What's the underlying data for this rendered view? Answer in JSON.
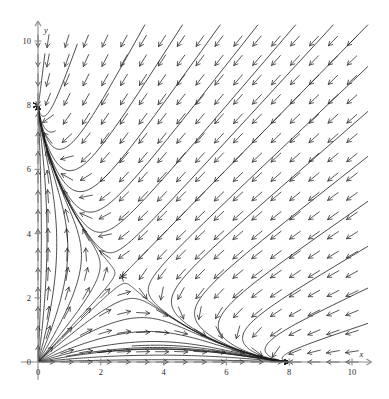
{
  "figure": {
    "title": "",
    "background_color": "#ffffff",
    "axis_color": "#8c8c8c",
    "arrow_color": "#3a3a3a",
    "trajectory_color": "#1d1d1d",
    "width": 389,
    "height": 399
  },
  "chart_data": {
    "type": "scatter",
    "plot_kind": "direction-field-phase-portrait",
    "title": "",
    "xlabel": "x",
    "ylabel": "y",
    "xlim": [
      0,
      10.6
    ],
    "ylim": [
      0,
      10.6
    ],
    "xticks": [
      0,
      2,
      4,
      6,
      8,
      10
    ],
    "yticks": [
      0,
      2,
      4,
      6,
      8,
      10
    ],
    "xtick_labels": [
      "0",
      "2",
      "4",
      "6",
      "8",
      "10"
    ],
    "ytick_labels": [
      "0",
      "2",
      "4",
      "6",
      "8",
      "10"
    ],
    "minor_tick_step": 0.5,
    "grid": false,
    "legend": null,
    "axes_position": "origin-crossed, arrows on both axes",
    "origin_px": [
      38,
      362
    ],
    "pixels_per_unit_x": 31.4,
    "pixels_per_unit_y": 32.1,
    "field": {
      "description": "normalized direction field of a two-species competition system",
      "glyph": "unit arrow with open arrowhead",
      "grid_cols": 18,
      "grid_rows": 18,
      "grid_x_start": 0.32,
      "grid_y_start": 0.32,
      "grid_step_x": 0.605,
      "grid_step_y": 0.605,
      "model": "dx/dt = x*(8 - x - 2*y)/8 ; dy/dt = y*(8 - 2*x - y)/8",
      "arrow_length_px": 13
    },
    "equilibria": [
      {
        "point": [
          0,
          0
        ],
        "label": "",
        "kind": "unstable node"
      },
      {
        "point": [
          8,
          0
        ],
        "label": "",
        "kind": "stable node"
      },
      {
        "point": [
          0,
          8
        ],
        "label": "",
        "kind": "stable node"
      },
      {
        "point": [
          3.2,
          3.2
        ],
        "label": "",
        "kind": "saddle"
      }
    ],
    "trajectory_count": 22
  }
}
